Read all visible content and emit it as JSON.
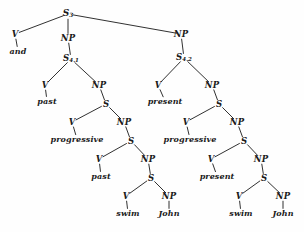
{
  "diagram": {
    "type": "syntax-tree",
    "canvas": {
      "width": 304,
      "height": 232,
      "background": "#fefefe"
    },
    "line_color": "#1a1a1a",
    "text_color": "#1a1a1a",
    "sentence": "and past progressive past swim John present progressive present swim John"
  },
  "nodes": [
    {
      "id": "n0",
      "label": "S",
      "sub": "3",
      "kind": "cat",
      "x": 68,
      "y": 14
    },
    {
      "id": "n1",
      "label": "V",
      "sub": "",
      "kind": "cat",
      "x": 15,
      "y": 34
    },
    {
      "id": "n2",
      "label": "and",
      "sub": "",
      "kind": "terminal",
      "x": 18,
      "y": 51
    },
    {
      "id": "n3",
      "label": "NP",
      "sub": "",
      "kind": "cat",
      "x": 68,
      "y": 38
    },
    {
      "id": "n4",
      "label": "NP",
      "sub": "",
      "kind": "cat",
      "x": 181,
      "y": 34
    },
    {
      "id": "n5",
      "label": "S",
      "sub": "4.1",
      "kind": "cat",
      "x": 71,
      "y": 59
    },
    {
      "id": "n6",
      "label": "S",
      "sub": "4.2",
      "kind": "cat",
      "x": 184,
      "y": 58
    },
    {
      "id": "n7",
      "label": "V",
      "sub": "",
      "kind": "cat",
      "x": 45,
      "y": 85
    },
    {
      "id": "n8",
      "label": "past",
      "sub": "",
      "kind": "terminal",
      "x": 47,
      "y": 101
    },
    {
      "id": "n9",
      "label": "NP",
      "sub": "",
      "kind": "cat",
      "x": 99,
      "y": 85
    },
    {
      "id": "n10",
      "label": "S",
      "sub": "",
      "kind": "cat",
      "x": 106,
      "y": 104
    },
    {
      "id": "n11",
      "label": "V",
      "sub": "",
      "kind": "cat",
      "x": 158,
      "y": 85
    },
    {
      "id": "n12",
      "label": "present",
      "sub": "",
      "kind": "terminal",
      "x": 165,
      "y": 101
    },
    {
      "id": "n13",
      "label": "NP",
      "sub": "",
      "kind": "cat",
      "x": 212,
      "y": 85
    },
    {
      "id": "n14",
      "label": "S",
      "sub": "",
      "kind": "cat",
      "x": 219,
      "y": 104
    },
    {
      "id": "n15",
      "label": "V",
      "sub": "",
      "kind": "cat",
      "x": 72,
      "y": 122
    },
    {
      "id": "n16",
      "label": "progressive",
      "sub": "",
      "kind": "terminal",
      "x": 77,
      "y": 139
    },
    {
      "id": "n17",
      "label": "NP",
      "sub": "",
      "kind": "cat",
      "x": 124,
      "y": 122
    },
    {
      "id": "n18",
      "label": "S",
      "sub": "",
      "kind": "cat",
      "x": 131,
      "y": 141
    },
    {
      "id": "n19",
      "label": "V",
      "sub": "",
      "kind": "cat",
      "x": 186,
      "y": 122
    },
    {
      "id": "n20",
      "label": "progressive",
      "sub": "",
      "kind": "terminal",
      "x": 190,
      "y": 139
    },
    {
      "id": "n21",
      "label": "NP",
      "sub": "",
      "kind": "cat",
      "x": 237,
      "y": 122
    },
    {
      "id": "n22",
      "label": "S",
      "sub": "",
      "kind": "cat",
      "x": 244,
      "y": 141
    },
    {
      "id": "n23",
      "label": "V",
      "sub": "",
      "kind": "cat",
      "x": 99,
      "y": 159
    },
    {
      "id": "n24",
      "label": "past",
      "sub": "",
      "kind": "terminal",
      "x": 101,
      "y": 176
    },
    {
      "id": "n25",
      "label": "NP",
      "sub": "",
      "kind": "cat",
      "x": 148,
      "y": 159
    },
    {
      "id": "n26",
      "label": "S",
      "sub": "",
      "kind": "cat",
      "x": 151,
      "y": 178
    },
    {
      "id": "n27",
      "label": "V",
      "sub": "",
      "kind": "cat",
      "x": 211,
      "y": 159
    },
    {
      "id": "n28",
      "label": "present",
      "sub": "",
      "kind": "terminal",
      "x": 217,
      "y": 176
    },
    {
      "id": "n29",
      "label": "NP",
      "sub": "",
      "kind": "cat",
      "x": 261,
      "y": 159
    },
    {
      "id": "n30",
      "label": "S",
      "sub": "",
      "kind": "cat",
      "x": 264,
      "y": 178
    },
    {
      "id": "n31",
      "label": "V",
      "sub": "",
      "kind": "cat",
      "x": 126,
      "y": 196
    },
    {
      "id": "n32",
      "label": "swim",
      "sub": "",
      "kind": "terminal",
      "x": 128,
      "y": 213
    },
    {
      "id": "n33",
      "label": "NP",
      "sub": "",
      "kind": "cat",
      "x": 169,
      "y": 196
    },
    {
      "id": "n34",
      "label": "John",
      "sub": "",
      "kind": "terminal",
      "x": 169,
      "y": 213
    },
    {
      "id": "n35",
      "label": "V",
      "sub": "",
      "kind": "cat",
      "x": 239,
      "y": 196
    },
    {
      "id": "n36",
      "label": "swim",
      "sub": "",
      "kind": "terminal",
      "x": 241,
      "y": 213
    },
    {
      "id": "n37",
      "label": "NP",
      "sub": "",
      "kind": "cat",
      "x": 283,
      "y": 196
    },
    {
      "id": "n38",
      "label": "John",
      "sub": "",
      "kind": "terminal",
      "x": 283,
      "y": 213
    }
  ],
  "edges": [
    {
      "from": "n0",
      "to": "n1"
    },
    {
      "from": "n0",
      "to": "n3"
    },
    {
      "from": "n0",
      "to": "n4"
    },
    {
      "from": "n1",
      "to": "n2"
    },
    {
      "from": "n3",
      "to": "n5"
    },
    {
      "from": "n4",
      "to": "n6"
    },
    {
      "from": "n5",
      "to": "n7"
    },
    {
      "from": "n5",
      "to": "n9"
    },
    {
      "from": "n7",
      "to": "n8"
    },
    {
      "from": "n9",
      "to": "n10"
    },
    {
      "from": "n6",
      "to": "n11"
    },
    {
      "from": "n6",
      "to": "n13"
    },
    {
      "from": "n11",
      "to": "n12"
    },
    {
      "from": "n13",
      "to": "n14"
    },
    {
      "from": "n10",
      "to": "n15"
    },
    {
      "from": "n10",
      "to": "n17"
    },
    {
      "from": "n15",
      "to": "n16"
    },
    {
      "from": "n17",
      "to": "n18"
    },
    {
      "from": "n14",
      "to": "n19"
    },
    {
      "from": "n14",
      "to": "n21"
    },
    {
      "from": "n19",
      "to": "n20"
    },
    {
      "from": "n21",
      "to": "n22"
    },
    {
      "from": "n18",
      "to": "n23"
    },
    {
      "from": "n18",
      "to": "n25"
    },
    {
      "from": "n23",
      "to": "n24"
    },
    {
      "from": "n25",
      "to": "n26"
    },
    {
      "from": "n22",
      "to": "n27"
    },
    {
      "from": "n22",
      "to": "n29"
    },
    {
      "from": "n27",
      "to": "n28"
    },
    {
      "from": "n29",
      "to": "n30"
    },
    {
      "from": "n26",
      "to": "n31"
    },
    {
      "from": "n26",
      "to": "n33"
    },
    {
      "from": "n31",
      "to": "n32"
    },
    {
      "from": "n33",
      "to": "n34"
    },
    {
      "from": "n30",
      "to": "n35"
    },
    {
      "from": "n30",
      "to": "n37"
    },
    {
      "from": "n35",
      "to": "n36"
    },
    {
      "from": "n37",
      "to": "n38"
    }
  ]
}
